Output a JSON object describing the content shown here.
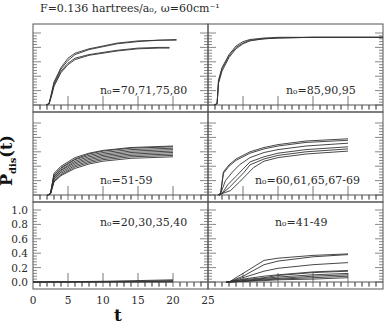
{
  "figure": {
    "title": "F=0.136 hartrees/a₀, ω=60cm⁻¹",
    "ylabel": "P_dis(t)",
    "ylabel_main": "P",
    "ylabel_sub": "dis",
    "ylabel_tail": "(t)",
    "xlabel": "t",
    "line_color": "#333333",
    "frame_color": "#555555"
  },
  "chart_data": {
    "type": "line",
    "xlabel": "t",
    "ylabel": "P_dis(t)",
    "xlim": [
      0,
      25
    ],
    "ylim": [
      0,
      1.0
    ],
    "x_ticks": [
      0,
      5,
      10,
      15,
      20,
      25
    ],
    "y_ticks": [
      0.0,
      0.2,
      0.4,
      0.6,
      0.8,
      1.0
    ],
    "grid": false,
    "layout": "3 rows x 2 columns, shared axes",
    "panels": [
      {
        "position": "top-left",
        "label": "n₀=70,71,75,80",
        "series": [
          {
            "name": "n0=70",
            "x": [
              2.3,
              2.6,
              3,
              4,
              5,
              6,
              8,
              10,
              12,
              15,
              18,
              20.5
            ],
            "y": [
              0.02,
              0.15,
              0.32,
              0.52,
              0.65,
              0.72,
              0.78,
              0.82,
              0.86,
              0.89,
              0.9,
              0.9
            ]
          },
          {
            "name": "n0=71",
            "x": [
              2.3,
              2.6,
              3,
              4,
              5,
              6,
              8,
              10,
              12,
              15,
              18,
              20.5
            ],
            "y": [
              0.02,
              0.13,
              0.3,
              0.5,
              0.62,
              0.7,
              0.77,
              0.81,
              0.85,
              0.88,
              0.9,
              0.91
            ]
          },
          {
            "name": "n0=75",
            "x": [
              2.3,
              2.6,
              3,
              4,
              5,
              6,
              8,
              10,
              12,
              15,
              18,
              19.5
            ],
            "y": [
              0.02,
              0.12,
              0.28,
              0.47,
              0.58,
              0.65,
              0.7,
              0.73,
              0.76,
              0.79,
              0.8,
              0.8
            ]
          },
          {
            "name": "n0=80",
            "x": [
              2.3,
              2.6,
              3,
              4,
              5,
              6,
              8,
              10,
              12,
              15,
              18,
              19.5
            ],
            "y": [
              0.02,
              0.11,
              0.26,
              0.45,
              0.56,
              0.63,
              0.69,
              0.72,
              0.75,
              0.78,
              0.79,
              0.79
            ]
          }
        ]
      },
      {
        "position": "top-right",
        "label": "n₀=85,90,95",
        "series": [
          {
            "name": "n0=85",
            "x": [
              1.3,
              1.5,
              2,
              3,
              4,
              5,
              6,
              8,
              10,
              15,
              20,
              25
            ],
            "y": [
              0.02,
              0.35,
              0.52,
              0.7,
              0.82,
              0.88,
              0.91,
              0.93,
              0.94,
              0.94,
              0.94,
              0.94
            ]
          },
          {
            "name": "n0=90",
            "x": [
              1.3,
              1.5,
              2,
              3,
              4,
              5,
              6,
              8,
              10,
              15,
              20,
              25
            ],
            "y": [
              0.02,
              0.32,
              0.5,
              0.68,
              0.8,
              0.86,
              0.9,
              0.92,
              0.93,
              0.94,
              0.94,
              0.94
            ]
          },
          {
            "name": "n0=95",
            "x": [
              1.3,
              1.5,
              2,
              3,
              4,
              5,
              6,
              8,
              10,
              15,
              20,
              25
            ],
            "y": [
              0.02,
              0.3,
              0.47,
              0.66,
              0.78,
              0.85,
              0.89,
              0.92,
              0.93,
              0.94,
              0.94,
              0.94
            ]
          }
        ]
      },
      {
        "position": "middle-left",
        "label": "n₀=51-59",
        "series": [
          {
            "name": "n0=51",
            "x": [
              2.5,
              3,
              4,
              6,
              8,
              10,
              14,
              20
            ],
            "y": [
              0.02,
              0.3,
              0.4,
              0.52,
              0.58,
              0.62,
              0.66,
              0.68
            ]
          },
          {
            "name": "n0=52",
            "x": [
              2.5,
              3,
              4,
              6,
              8,
              10,
              14,
              20
            ],
            "y": [
              0.02,
              0.28,
              0.38,
              0.5,
              0.57,
              0.61,
              0.65,
              0.67
            ]
          },
          {
            "name": "n0=53",
            "x": [
              2.5,
              3,
              4,
              6,
              8,
              10,
              14,
              20
            ],
            "y": [
              0.02,
              0.27,
              0.37,
              0.49,
              0.55,
              0.59,
              0.63,
              0.65
            ]
          },
          {
            "name": "n0=54",
            "x": [
              2.5,
              3,
              4,
              6,
              8,
              10,
              14,
              20
            ],
            "y": [
              0.02,
              0.25,
              0.35,
              0.47,
              0.53,
              0.57,
              0.61,
              0.63
            ]
          },
          {
            "name": "n0=55",
            "x": [
              2.5,
              3,
              4,
              6,
              8,
              10,
              14,
              20
            ],
            "y": [
              0.02,
              0.24,
              0.34,
              0.45,
              0.51,
              0.55,
              0.59,
              0.61
            ]
          },
          {
            "name": "n0=56",
            "x": [
              2.5,
              3,
              4,
              6,
              8,
              10,
              14,
              20
            ],
            "y": [
              0.02,
              0.22,
              0.32,
              0.43,
              0.49,
              0.53,
              0.57,
              0.59
            ]
          },
          {
            "name": "n0=57",
            "x": [
              2.5,
              3,
              4,
              6,
              8,
              10,
              14,
              20
            ],
            "y": [
              0.02,
              0.2,
              0.3,
              0.41,
              0.47,
              0.51,
              0.55,
              0.57
            ]
          },
          {
            "name": "n0=58",
            "x": [
              2.5,
              3,
              4,
              6,
              8,
              10,
              14,
              20
            ],
            "y": [
              0.02,
              0.19,
              0.28,
              0.39,
              0.45,
              0.49,
              0.53,
              0.55
            ]
          },
          {
            "name": "n0=59",
            "x": [
              2.5,
              3,
              4,
              6,
              8,
              10,
              14,
              20
            ],
            "y": [
              0.02,
              0.18,
              0.27,
              0.37,
              0.43,
              0.47,
              0.51,
              0.53
            ]
          }
        ]
      },
      {
        "position": "middle-right",
        "label": "n₀=60,61,65,67-69",
        "series": [
          {
            "name": "n0=60",
            "x": [
              1.8,
              2.2,
              3,
              4,
              6,
              8,
              10,
              14,
              20
            ],
            "y": [
              0.02,
              0.32,
              0.42,
              0.5,
              0.6,
              0.66,
              0.7,
              0.75,
              0.78
            ]
          },
          {
            "name": "n0=61",
            "x": [
              1.8,
              2.2,
              3,
              4,
              6,
              8,
              10,
              14,
              20
            ],
            "y": [
              0.02,
              0.3,
              0.4,
              0.48,
              0.58,
              0.64,
              0.68,
              0.73,
              0.76
            ]
          },
          {
            "name": "n0=65",
            "x": [
              1.8,
              2.5,
              3.5,
              4.5,
              6,
              8,
              10,
              14,
              20
            ],
            "y": [
              0.02,
              0.2,
              0.32,
              0.42,
              0.52,
              0.59,
              0.63,
              0.68,
              0.72
            ]
          },
          {
            "name": "n0=67",
            "x": [
              2,
              2.8,
              4,
              5,
              6,
              8,
              10,
              14,
              20
            ],
            "y": [
              0.02,
              0.14,
              0.26,
              0.36,
              0.46,
              0.53,
              0.58,
              0.63,
              0.67
            ]
          },
          {
            "name": "n0=68",
            "x": [
              2,
              3,
              4.2,
              5.2,
              6,
              8,
              10,
              14,
              20
            ],
            "y": [
              0.02,
              0.1,
              0.22,
              0.32,
              0.42,
              0.5,
              0.55,
              0.6,
              0.64
            ]
          },
          {
            "name": "n0=69",
            "x": [
              2,
              3.2,
              4.5,
              5.5,
              6.5,
              8,
              10,
              14,
              20
            ],
            "y": [
              0.02,
              0.06,
              0.18,
              0.28,
              0.38,
              0.47,
              0.52,
              0.57,
              0.61
            ]
          }
        ]
      },
      {
        "position": "bottom-left",
        "label": "n₀=20,30,35,40",
        "series": [
          {
            "name": "n0=20",
            "x": [
              0,
              10,
              20
            ],
            "y": [
              0.0,
              0.0,
              0.0
            ]
          },
          {
            "name": "n0=30",
            "x": [
              0,
              10,
              20
            ],
            "y": [
              0.0,
              0.0,
              0.01
            ]
          },
          {
            "name": "n0=35",
            "x": [
              0,
              10,
              15,
              20
            ],
            "y": [
              0.0,
              0.005,
              0.01,
              0.02
            ]
          },
          {
            "name": "n0=40",
            "x": [
              0,
              10,
              15,
              20
            ],
            "y": [
              0.0,
              0.01,
              0.02,
              0.03
            ]
          }
        ]
      },
      {
        "position": "bottom-right",
        "label": "n₀=41-49",
        "series": [
          {
            "name": "n0=41",
            "x": [
              3,
              5,
              8,
              10,
              15,
              20
            ],
            "y": [
              0.0,
              0.12,
              0.3,
              0.33,
              0.37,
              0.39
            ]
          },
          {
            "name": "n0=42",
            "x": [
              3,
              5,
              8,
              10,
              15,
              20
            ],
            "y": [
              0.0,
              0.08,
              0.24,
              0.29,
              0.35,
              0.38
            ]
          },
          {
            "name": "n0=43",
            "x": [
              3,
              5,
              8,
              10,
              15,
              20
            ],
            "y": [
              0.0,
              0.06,
              0.15,
              0.19,
              0.24,
              0.27
            ]
          },
          {
            "name": "n0=44",
            "x": [
              3,
              5,
              8,
              10,
              15,
              20
            ],
            "y": [
              0.0,
              0.04,
              0.08,
              0.1,
              0.14,
              0.16
            ]
          },
          {
            "name": "n0=45",
            "x": [
              3,
              5,
              8,
              10,
              15,
              20
            ],
            "y": [
              0.0,
              0.03,
              0.06,
              0.09,
              0.13,
              0.15
            ]
          },
          {
            "name": "n0=46",
            "x": [
              3,
              5,
              8,
              10,
              15,
              20
            ],
            "y": [
              0.0,
              0.02,
              0.05,
              0.07,
              0.1,
              0.12
            ]
          },
          {
            "name": "n0=47",
            "x": [
              3,
              5,
              8,
              10,
              15,
              20
            ],
            "y": [
              0.0,
              0.01,
              0.04,
              0.05,
              0.08,
              0.1
            ]
          },
          {
            "name": "n0=48",
            "x": [
              3,
              5,
              8,
              10,
              15,
              20
            ],
            "y": [
              0.0,
              0.01,
              0.03,
              0.04,
              0.06,
              0.08
            ]
          },
          {
            "name": "n0=49",
            "x": [
              3,
              5,
              8,
              10,
              15,
              20
            ],
            "y": [
              0.0,
              0.01,
              0.02,
              0.03,
              0.04,
              0.06
            ]
          }
        ]
      }
    ]
  }
}
